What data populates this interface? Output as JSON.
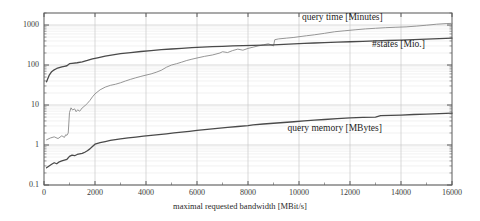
{
  "chart_data": {
    "type": "line",
    "title": "",
    "xlabel": "maximal requested bandwidth [MBit/s]",
    "ylabel": "",
    "yscale": "log",
    "xlim": [
      0,
      16000
    ],
    "ylim": [
      0.1,
      2000
    ],
    "grid": true,
    "legend_position": "inline-right",
    "xticks": [
      0,
      2000,
      4000,
      6000,
      8000,
      10000,
      12000,
      14000,
      16000
    ],
    "xticklabels": [
      "0",
      "2000",
      "4000",
      "6000",
      "8000",
      "10000",
      "12000",
      "14000",
      "16000"
    ],
    "yticks": [
      0.1,
      1,
      10,
      100,
      1000
    ],
    "yticklabels": [
      "0.1",
      "1",
      "10",
      "100",
      "1000"
    ],
    "series": [
      {
        "name": "query time [Minutes]",
        "color": "#8a8a8a",
        "label_x": 11700,
        "label_y": 1450,
        "x": [
          100,
          250,
          400,
          550,
          700,
          800,
          850,
          900,
          950,
          1000,
          1060,
          1120,
          1200,
          1260,
          1320,
          1400,
          1500,
          1600,
          1700,
          1800,
          1900,
          2000,
          2200,
          2400,
          2600,
          2800,
          3000,
          3200,
          3400,
          3600,
          3800,
          4000,
          4200,
          4400,
          4600,
          4800,
          5000,
          5200,
          5400,
          5600,
          5800,
          6000,
          6300,
          6600,
          6900,
          7000,
          7200,
          7400,
          7600,
          7800,
          8000,
          8200,
          8400,
          8600,
          8800,
          9000,
          9050,
          9200,
          9500,
          9800,
          10000,
          10300,
          10600,
          11000,
          11400,
          11800,
          12200,
          12600,
          13000,
          13400,
          13800,
          14200,
          14600,
          15000,
          15400,
          15800,
          16000
        ],
        "y": [
          1.35,
          1.5,
          1.6,
          1.45,
          1.7,
          1.55,
          1.8,
          1.75,
          2.0,
          6.5,
          8.5,
          7.5,
          8.0,
          6.8,
          7.6,
          7.0,
          8.5,
          9.5,
          11,
          13,
          16,
          19,
          24,
          28,
          31,
          33,
          36,
          40,
          44,
          48,
          52,
          56,
          60,
          66,
          74,
          88,
          100,
          108,
          118,
          130,
          140,
          150,
          165,
          178,
          200,
          215,
          205,
          230,
          250,
          235,
          260,
          280,
          300,
          320,
          340,
          300,
          430,
          450,
          470,
          490,
          510,
          540,
          570,
          620,
          680,
          720,
          760,
          800,
          830,
          860,
          880,
          900,
          940,
          990,
          1050,
          1090,
          1100
        ]
      },
      {
        "name": "#states [Mio.]",
        "color": "#4a4a4a",
        "label_x": 13900,
        "label_y": 300,
        "x": [
          100,
          200,
          300,
          400,
          500,
          600,
          700,
          800,
          900,
          1000,
          1100,
          1300,
          1500,
          1700,
          1900,
          2100,
          2400,
          2700,
          3000,
          3400,
          3800,
          4200,
          4600,
          5000,
          5400,
          5800,
          6200,
          6600,
          7000,
          7400,
          7800,
          8200,
          8600,
          9000,
          9400,
          9800,
          10200,
          10600,
          11000,
          11500,
          12000,
          12500,
          13000,
          13500,
          14000,
          14500,
          15000,
          15500,
          16000
        ],
        "y": [
          38,
          55,
          68,
          76,
          82,
          86,
          90,
          93,
          96,
          108,
          110,
          114,
          120,
          130,
          142,
          152,
          168,
          180,
          192,
          205,
          218,
          230,
          242,
          252,
          262,
          272,
          280,
          288,
          294,
          300,
          305,
          310,
          315,
          320,
          328,
          338,
          348,
          355,
          362,
          372,
          382,
          392,
          400,
          410,
          420,
          432,
          444,
          456,
          470
        ]
      },
      {
        "name": "query memory [MBytes]",
        "color": "#4a4a4a",
        "label_x": 11400,
        "label_y": 2.4,
        "x": [
          100,
          200,
          300,
          400,
          500,
          600,
          700,
          800,
          900,
          1000,
          1100,
          1200,
          1300,
          1400,
          1500,
          1600,
          1700,
          1800,
          1900,
          2000,
          2200,
          2400,
          2600,
          2800,
          3000,
          3300,
          3600,
          3900,
          4200,
          4500,
          4800,
          5100,
          5400,
          5700,
          6000,
          6400,
          6800,
          7200,
          7600,
          8000,
          8200,
          8600,
          9000,
          9400,
          9800,
          10200,
          10600,
          11000,
          11500,
          12000,
          12500,
          13000,
          13200,
          13600,
          14000,
          14500,
          15000,
          15500,
          16000
        ],
        "y": [
          0.27,
          0.3,
          0.33,
          0.36,
          0.34,
          0.38,
          0.4,
          0.42,
          0.44,
          0.52,
          0.56,
          0.54,
          0.58,
          0.6,
          0.62,
          0.66,
          0.72,
          0.8,
          0.92,
          1.05,
          1.15,
          1.22,
          1.3,
          1.36,
          1.42,
          1.5,
          1.58,
          1.66,
          1.74,
          1.82,
          1.9,
          2.0,
          2.1,
          2.2,
          2.32,
          2.46,
          2.6,
          2.75,
          2.9,
          3.05,
          3.2,
          3.35,
          3.5,
          3.66,
          3.82,
          4.0,
          4.18,
          4.35,
          4.55,
          4.75,
          4.9,
          5.0,
          5.4,
          5.5,
          5.62,
          5.8,
          5.95,
          6.1,
          6.25
        ]
      }
    ]
  },
  "plot_area": {
    "left": 44,
    "top": 13,
    "right": 452,
    "bottom": 185
  },
  "style": {
    "axis_color": "#5a5a5a",
    "major_grid_color": "#c9c9c9",
    "minor_grid_color": "#e4e4e4",
    "background": "#ffffff"
  }
}
